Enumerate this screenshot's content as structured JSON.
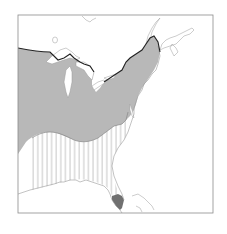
{
  "map": {
    "region": "Eastern North America",
    "legend": [],
    "zones": [
      {
        "id": "northern-range",
        "fill": "gray-shaded",
        "color": "#b5b5b5"
      },
      {
        "id": "southern-range",
        "fill": "vertical-hatch",
        "color": "#8a8a8a"
      },
      {
        "id": "florida-tip",
        "fill": "dark-shaded",
        "color": "#6f6f6f"
      }
    ],
    "colors": {
      "background": "#ffffff",
      "frame": "#8c8c8c",
      "coast": "#9a9a9a",
      "northern_boundary": "#222222",
      "shade": "#b8b8b8",
      "hatch": "#9a9a9a",
      "dark": "#707070"
    }
  }
}
